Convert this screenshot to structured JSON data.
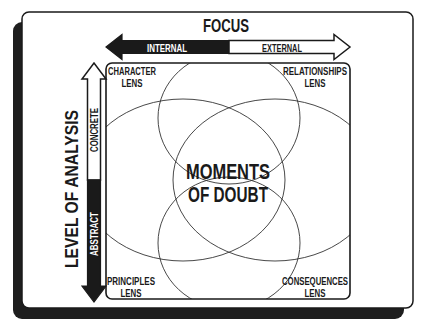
{
  "title": "FOCUS",
  "horizontal_axis": {
    "label": "FOCUS",
    "left_end": "INTERNAL",
    "right_end": "EXTERNAL"
  },
  "vertical_axis": {
    "label": "LEVEL OF ANALYSIS",
    "top_end": "CONCRETE",
    "bottom_end": "ABSTRACT"
  },
  "center": {
    "line1": "MOMENTS",
    "line2": "OF DOUBT"
  },
  "lenses": {
    "top_left": {
      "line1": "CHARACTER",
      "line2": "LENS"
    },
    "top_right": {
      "line1": "RELATIONSHIPS",
      "line2": "LENS"
    },
    "bottom_left": {
      "line1": "PRINCIPLES",
      "line2": "LENS"
    },
    "bottom_right": {
      "line1": "CONSEQUENCES",
      "line2": "LENS"
    }
  },
  "colors": {
    "ink": "#1a1a1a",
    "paper": "#ffffff",
    "shadow": "#1e1e1e"
  }
}
